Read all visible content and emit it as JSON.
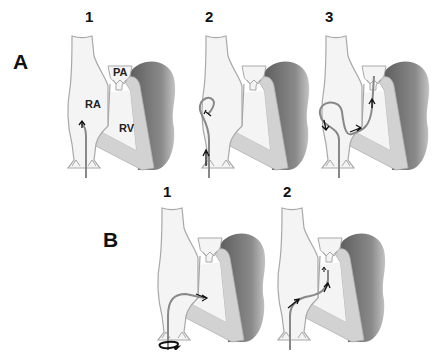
{
  "figure": {
    "rows": [
      {
        "label": "A",
        "panels": [
          {
            "number": "1",
            "anatomy_labels": {
              "pa": "PA",
              "ra": "RA",
              "rv": "RV"
            }
          },
          {
            "number": "2"
          },
          {
            "number": "3"
          }
        ]
      },
      {
        "label": "B",
        "panels": [
          {
            "number": "1"
          },
          {
            "number": "2"
          }
        ]
      }
    ],
    "colors": {
      "background": "#ffffff",
      "vessel_fill": "#f4f4f4",
      "vessel_stroke": "#a8a8a8",
      "myocardium": "#d2d2d2",
      "heart_shadow": "#707070",
      "catheter": "#888888",
      "arrow": "#111111",
      "text": "#111111"
    }
  }
}
